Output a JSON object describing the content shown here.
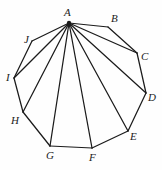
{
  "figure": {
    "name": "decagon-with-diagonals-from-A",
    "width": 162,
    "height": 170,
    "background_color": "#fefefe",
    "stroke_color": "#1b1b1b",
    "stroke_width": 1.25,
    "apex_dot_color": "#1b1b1b"
  },
  "vertices": [
    {
      "id": "A",
      "label": "A",
      "x": 69,
      "y": 23,
      "label_x": 64,
      "label_y": 7
    },
    {
      "id": "B",
      "label": "B",
      "x": 108,
      "y": 27,
      "label_x": 111,
      "label_y": 13
    },
    {
      "id": "C",
      "label": "C",
      "x": 137,
      "y": 53,
      "label_x": 141,
      "label_y": 51
    },
    {
      "id": "D",
      "label": "D",
      "x": 146,
      "y": 93,
      "label_x": 148,
      "label_y": 92
    },
    {
      "id": "E",
      "label": "E",
      "x": 128,
      "y": 131,
      "label_x": 130,
      "label_y": 131
    },
    {
      "id": "F",
      "label": "F",
      "x": 92,
      "y": 148,
      "label_x": 89,
      "label_y": 152
    },
    {
      "id": "G",
      "label": "G",
      "x": 50,
      "y": 146,
      "label_x": 46,
      "label_y": 150
    },
    {
      "id": "H",
      "label": "H",
      "x": 23,
      "y": 112,
      "label_x": 11,
      "label_y": 115
    },
    {
      "id": "I",
      "label": "I",
      "x": 14,
      "y": 78,
      "label_x": 6,
      "label_y": 72
    },
    {
      "id": "J",
      "label": "J",
      "x": 32,
      "y": 41,
      "label_x": 24,
      "label_y": 34
    }
  ],
  "perimeter_edges": [
    [
      "A",
      "B"
    ],
    [
      "B",
      "C"
    ],
    [
      "C",
      "D"
    ],
    [
      "D",
      "E"
    ],
    [
      "E",
      "F"
    ],
    [
      "F",
      "G"
    ],
    [
      "G",
      "H"
    ],
    [
      "H",
      "I"
    ],
    [
      "I",
      "J"
    ],
    [
      "J",
      "A"
    ]
  ],
  "diagonals_from_apex": [
    [
      "A",
      "C"
    ],
    [
      "A",
      "D"
    ],
    [
      "A",
      "E"
    ],
    [
      "A",
      "F"
    ],
    [
      "A",
      "G"
    ],
    [
      "A",
      "H"
    ],
    [
      "A",
      "I"
    ]
  ],
  "apex_vertex": "A"
}
